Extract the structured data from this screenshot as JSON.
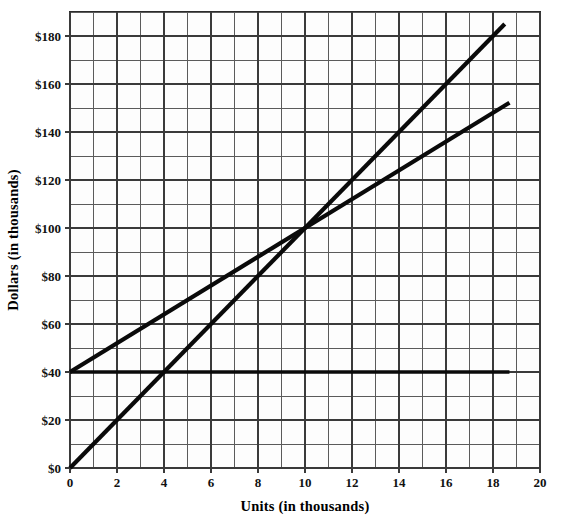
{
  "chart_data": {
    "type": "line",
    "title": "",
    "xlabel": "Units (in thousands)",
    "ylabel": "Dollars (in thousands)",
    "xlim": [
      0,
      20
    ],
    "ylim": [
      0,
      190
    ],
    "xticks": [
      "0",
      "2",
      "4",
      "6",
      "8",
      "10",
      "12",
      "14",
      "16",
      "18",
      "20"
    ],
    "xtick_values": [
      0,
      2,
      4,
      6,
      8,
      10,
      12,
      14,
      16,
      18,
      20
    ],
    "yticks": [
      "$0",
      "$20",
      "$40",
      "$60",
      "$80",
      "$100",
      "$120",
      "$140",
      "$160",
      "$180"
    ],
    "ytick_values": [
      0,
      20,
      40,
      60,
      80,
      100,
      120,
      140,
      160,
      180
    ],
    "grid": true,
    "grid_minor_x_step": 1,
    "grid_minor_y_step": 10,
    "legend": "none",
    "series": [
      {
        "name": "Total revenues",
        "x": [
          0,
          18.5
        ],
        "values": [
          0,
          185
        ],
        "slope_per_unit": 10,
        "intercept": 0
      },
      {
        "name": "Total expenses",
        "x": [
          0,
          18.7
        ],
        "values": [
          40,
          152.2
        ],
        "slope_per_unit": 6,
        "intercept": 40
      },
      {
        "name": "Fixed expenses",
        "x": [
          0,
          18.7
        ],
        "values": [
          40,
          40
        ],
        "slope_per_unit": 0,
        "intercept": 40
      }
    ],
    "annotations": [
      {
        "name": "break-even-point",
        "text": "Break-even point",
        "point_x": 10,
        "point_y": 100,
        "label_x": 4.2,
        "label_y": 122
      },
      {
        "name": "total-revenues",
        "text": "Total revenues",
        "point_x": 11.2,
        "point_y": 112,
        "label_x": 9.0,
        "label_y": 158
      },
      {
        "name": "total-expenses",
        "text": "Total expenses",
        "point_x": 14.1,
        "point_y": 124,
        "label_x": 13.2,
        "label_y": 101
      },
      {
        "name": "fixed-expenses",
        "text": "Fixed expenses",
        "point_x": 12.4,
        "point_y": 40,
        "label_x": 12.5,
        "label_y": 62
      }
    ]
  },
  "labels": {
    "y_axis_title": "Dollars (in thousands)",
    "x_axis_title": "Units (in thousands)",
    "break_even": "Break-even point",
    "total_revenues": "Total revenues",
    "total_expenses": "Total expenses",
    "fixed_expenses": "Fixed expenses"
  },
  "ytick_0": "$0",
  "ytick_1": "$20",
  "ytick_2": "$40",
  "ytick_3": "$60",
  "ytick_4": "$80",
  "ytick_5": "$100",
  "ytick_6": "$120",
  "ytick_7": "$140",
  "ytick_8": "$160",
  "ytick_9": "$180",
  "xtick_0": "0",
  "xtick_1": "2",
  "xtick_2": "4",
  "xtick_3": "6",
  "xtick_4": "8",
  "xtick_5": "10",
  "xtick_6": "12",
  "xtick_7": "14",
  "xtick_8": "16",
  "xtick_9": "18",
  "xtick_10": "20",
  "colors": {
    "line": "#0a0a0a",
    "grid_minor": "#5b5b5b",
    "grid_major": "#3a3a3a",
    "background": "#ffffff",
    "plot_background": "#fdfdfd"
  }
}
